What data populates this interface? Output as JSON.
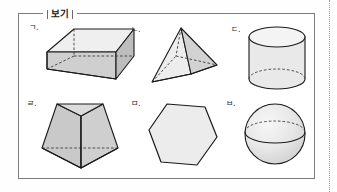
{
  "page": {
    "background_color": "#fefefe",
    "margin_rule": "dotted-vertical-page-margin"
  },
  "box": {
    "title": "보기",
    "border_color": "#7d7d7d"
  },
  "palette": {
    "outline": "#1a1a1a",
    "face_light": "#efefef",
    "face_mid": "#d9d9d9",
    "face_dark": "#c2c2c2",
    "hidden_edge": "#4a4a4a"
  },
  "items": [
    {
      "label": "ㄱ.",
      "shape_name": "rectangular-prism",
      "description": "직육면체"
    },
    {
      "label": "ㄴ.",
      "shape_name": "square-pyramid",
      "description": "사각뿔"
    },
    {
      "label": "ㄷ.",
      "shape_name": "cylinder",
      "description": "원기둥"
    },
    {
      "label": "ㄹ.",
      "shape_name": "truncated-pyramid",
      "description": "각뿔대"
    },
    {
      "label": "ㅁ.",
      "shape_name": "hexagon",
      "description": "육각형"
    },
    {
      "label": "ㅂ.",
      "shape_name": "sphere",
      "description": "구"
    }
  ]
}
